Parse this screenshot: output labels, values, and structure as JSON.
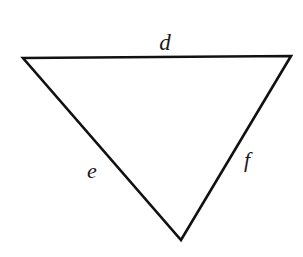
{
  "figure": {
    "kind": "triangle-diagram",
    "background_color": "#ffffff",
    "stroke_color": "#111111",
    "stroke_width": 2.6,
    "fill_color": "#ffffff",
    "width": 303,
    "height": 257,
    "vertices": {
      "top_left": {
        "x": 23,
        "y": 58
      },
      "top_right": {
        "x": 291,
        "y": 56
      },
      "bottom": {
        "x": 181,
        "y": 240
      }
    },
    "path": "M 23 58 L 291 56 L 181 240 Z",
    "labels": {
      "top_side": "d",
      "left_side": "e",
      "right_side": "f"
    },
    "label_positions": {
      "top_side": {
        "x": 165,
        "y": 42
      },
      "left_side": {
        "x": 92,
        "y": 171
      },
      "right_side": {
        "x": 247,
        "y": 160
      }
    },
    "label_color": "#1a1a1a"
  }
}
